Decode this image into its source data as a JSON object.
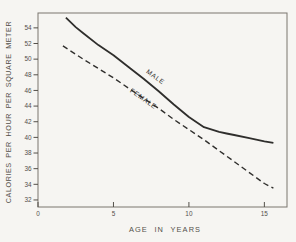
{
  "figure": {
    "background": "#f6f5f2",
    "ink": "#2f2e2c",
    "text_color": "#54504a",
    "axis_color": "#7a766f"
  },
  "chart_data": {
    "type": "line",
    "title": "",
    "xlabel": "AGE IN YEARS",
    "ylabel": "CALORIES PER HOUR PER SQUARE METER",
    "xlim": [
      0,
      16.5
    ],
    "ylim": [
      31.1,
      55.9
    ],
    "x_ticks": [
      0,
      5,
      10,
      15
    ],
    "y_ticks": [
      32,
      34,
      36,
      38,
      40,
      42,
      44,
      46,
      48,
      50,
      52,
      54
    ],
    "grid": false,
    "legend": "inline-rotated-labels",
    "series": [
      {
        "name": "MALE",
        "line_style": "solid",
        "stroke_width": 1.8,
        "dash": "",
        "label": {
          "age": 7.7,
          "cal": 47.5,
          "angle": 36
        },
        "points": [
          [
            1.85,
            55.3
          ],
          [
            2.5,
            54.1
          ],
          [
            3,
            53.3
          ],
          [
            4,
            51.8
          ],
          [
            5,
            50.5
          ],
          [
            6,
            49.0
          ],
          [
            7,
            47.5
          ],
          [
            8,
            45.9
          ],
          [
            9,
            44.2
          ],
          [
            10,
            42.6
          ],
          [
            11,
            41.3
          ],
          [
            12,
            40.7
          ],
          [
            12.5,
            40.5
          ],
          [
            13,
            40.3
          ],
          [
            14,
            39.9
          ],
          [
            15,
            39.5
          ],
          [
            15.6,
            39.3
          ]
        ]
      },
      {
        "name": "FEMALE",
        "line_style": "dashed",
        "stroke_width": 1.4,
        "dash": "5.5 3.5",
        "label": {
          "age": 6.9,
          "cal": 44.7,
          "angle": 35
        },
        "points": [
          [
            1.65,
            51.7
          ],
          [
            3,
            50.0
          ],
          [
            4,
            48.8
          ],
          [
            5,
            47.6
          ],
          [
            6,
            46.3
          ],
          [
            7,
            45.0
          ],
          [
            8,
            43.7
          ],
          [
            9,
            42.3
          ],
          [
            10,
            41.0
          ],
          [
            11,
            39.7
          ],
          [
            12,
            38.3
          ],
          [
            13,
            36.9
          ],
          [
            14,
            35.5
          ],
          [
            15,
            34.1
          ],
          [
            15.6,
            33.5
          ]
        ]
      }
    ]
  }
}
